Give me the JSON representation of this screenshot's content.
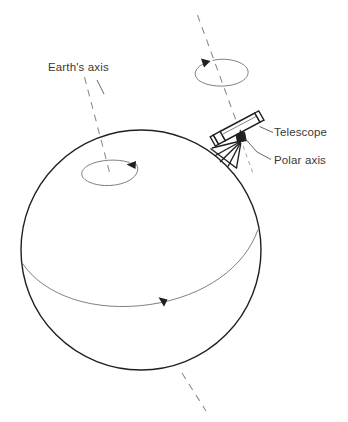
{
  "figure": {
    "title": "Polar-aligned telescope on the rotating Earth",
    "background_color": "#ffffff",
    "ink_color": "#231f20",
    "dash_color": "#8b898b",
    "width": 348,
    "height": 422
  },
  "labels": {
    "earth_axis": "Earth's axis",
    "telescope": "Telescope",
    "polar_axis": "Polar axis"
  },
  "elements": {
    "earth_sphere": {
      "name": "Earth",
      "center_x": 141,
      "center_y": 250,
      "radius": 120
    },
    "equator": {
      "name": "Equator / rotation circle",
      "direction_arrow": "down-left"
    },
    "pole_rotation": {
      "name": "Earth rotation ellipse at north pole",
      "center_x": 110,
      "center_y": 170,
      "rx": 30,
      "ry": 14,
      "direction_arrow": "left"
    },
    "polar_rotation": {
      "name": "Telescope polar-axis rotation ellipse",
      "center_x": 222,
      "center_y": 72,
      "rx": 26,
      "ry": 13,
      "direction_arrow": "up-left"
    },
    "earth_axis_line": {
      "name": "Earth's axis dashed line",
      "style": "dashed"
    },
    "polar_axis_line": {
      "name": "Polar axis dashed line",
      "style": "dashed"
    },
    "telescope_assembly": {
      "name": "Telescope tube on equatorial mount",
      "tube_angle_deg": -22
    }
  }
}
